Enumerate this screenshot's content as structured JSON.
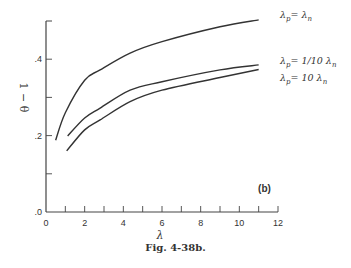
{
  "chart_data": {
    "type": "line",
    "title": "",
    "panel_label": "(b)",
    "xlabel": "λ",
    "ylabel": "1 − θ",
    "xlim": [
      0,
      12
    ],
    "ylim": [
      0,
      0.5
    ],
    "xticks": [
      0,
      2,
      4,
      6,
      8,
      10,
      12
    ],
    "xtick_labels": [
      "0",
      "2",
      "4",
      "6",
      "8",
      "10",
      "12"
    ],
    "yticks": [
      0,
      0.1,
      0.2,
      0.3,
      0.4,
      0.5
    ],
    "ytick_labels": [
      ".0",
      "",
      ".2",
      "",
      ".4",
      ""
    ],
    "grid": false,
    "legend_position": "inline-right",
    "series": [
      {
        "name": "λp = λn",
        "label_parts": [
          "λ",
          "p",
          "= λ",
          "n"
        ],
        "x": [
          0.5,
          1.0,
          2.0,
          2.8,
          4.35,
          6.0,
          9.0,
          11.0
        ],
        "y": [
          0.188,
          0.26,
          0.345,
          0.372,
          0.416,
          0.446,
          0.485,
          0.503
        ]
      },
      {
        "name": "λp = 1/10 λn",
        "label_parts": [
          "λ",
          "p",
          "= 1/10 λ",
          "n"
        ],
        "x": [
          1.12,
          2.0,
          2.8,
          4.35,
          6.0,
          9.0,
          11.0
        ],
        "y": [
          0.199,
          0.246,
          0.272,
          0.319,
          0.341,
          0.372,
          0.385
        ]
      },
      {
        "name": "λp = 10 λn",
        "label_parts": [
          "λ",
          "p",
          "= 10  λ",
          "n"
        ],
        "x": [
          1.07,
          2.0,
          2.8,
          4.35,
          6.0,
          9.0,
          11.0
        ],
        "y": [
          0.16,
          0.215,
          0.241,
          0.289,
          0.319,
          0.352,
          0.373
        ]
      }
    ]
  },
  "caption": "Fig. 4-38b.",
  "colors": {
    "line": "#333333",
    "axis": "#444444",
    "background": "#ffffff"
  }
}
